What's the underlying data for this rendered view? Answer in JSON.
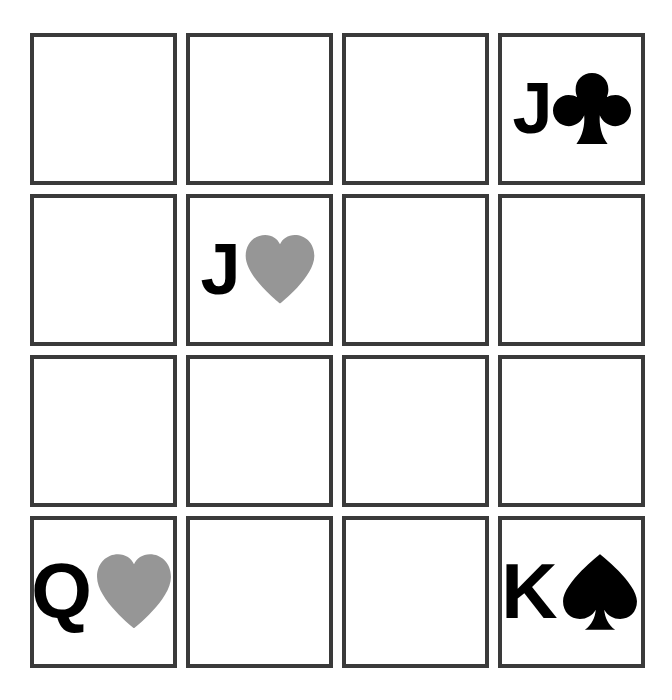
{
  "board": {
    "title": "Playing Card Grid",
    "rows": 4,
    "columns": 4,
    "colors": {
      "background": "#ffffff",
      "card_border": "#3a3a3a",
      "card_face": "#ffffff",
      "black_suit": "#000000",
      "red_suit_rendered": "#969696"
    },
    "cells": [
      {
        "row": 1,
        "col": 1,
        "empty": true,
        "rank": "",
        "suit": "",
        "suit_symbol": "",
        "color": ""
      },
      {
        "row": 1,
        "col": 2,
        "empty": true,
        "rank": "",
        "suit": "",
        "suit_symbol": "",
        "color": ""
      },
      {
        "row": 1,
        "col": 3,
        "empty": true,
        "rank": "",
        "suit": "",
        "suit_symbol": "",
        "color": ""
      },
      {
        "row": 1,
        "col": 4,
        "empty": false,
        "rank": "J",
        "suit": "clubs",
        "suit_symbol": "♣",
        "color": "#000000"
      },
      {
        "row": 2,
        "col": 1,
        "empty": true,
        "rank": "",
        "suit": "",
        "suit_symbol": "",
        "color": ""
      },
      {
        "row": 2,
        "col": 2,
        "empty": false,
        "rank": "J",
        "suit": "hearts",
        "suit_symbol": "♥",
        "color": "#969696"
      },
      {
        "row": 2,
        "col": 3,
        "empty": true,
        "rank": "",
        "suit": "",
        "suit_symbol": "",
        "color": ""
      },
      {
        "row": 2,
        "col": 4,
        "empty": true,
        "rank": "",
        "suit": "",
        "suit_symbol": "",
        "color": ""
      },
      {
        "row": 3,
        "col": 1,
        "empty": true,
        "rank": "",
        "suit": "",
        "suit_symbol": "",
        "color": ""
      },
      {
        "row": 3,
        "col": 2,
        "empty": true,
        "rank": "",
        "suit": "",
        "suit_symbol": "",
        "color": ""
      },
      {
        "row": 3,
        "col": 3,
        "empty": true,
        "rank": "",
        "suit": "",
        "suit_symbol": "",
        "color": ""
      },
      {
        "row": 3,
        "col": 4,
        "empty": true,
        "rank": "",
        "suit": "",
        "suit_symbol": "",
        "color": ""
      },
      {
        "row": 4,
        "col": 1,
        "empty": false,
        "rank": "Q",
        "suit": "hearts",
        "suit_symbol": "♥",
        "color": "#969696"
      },
      {
        "row": 4,
        "col": 2,
        "empty": true,
        "rank": "",
        "suit": "",
        "suit_symbol": "",
        "color": ""
      },
      {
        "row": 4,
        "col": 3,
        "empty": true,
        "rank": "",
        "suit": "",
        "suit_symbol": "",
        "color": ""
      },
      {
        "row": 4,
        "col": 4,
        "empty": false,
        "rank": "K",
        "suit": "spades",
        "suit_symbol": "♠",
        "color": "#000000"
      }
    ]
  }
}
